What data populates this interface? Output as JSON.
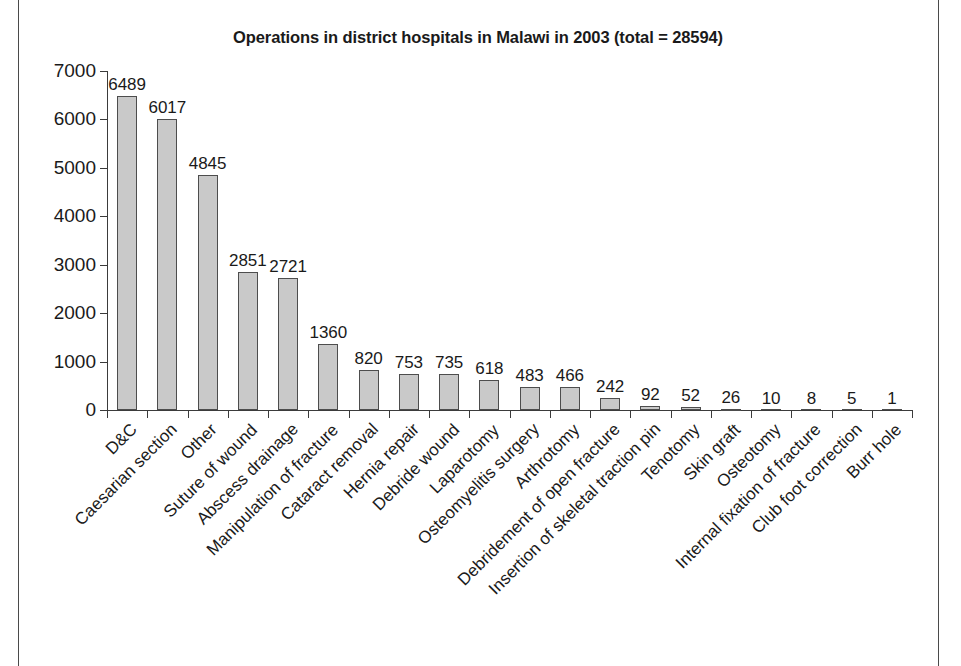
{
  "chart_data": {
    "type": "bar",
    "title": "Operations in district hospitals in Malawi in 2003 (total = 28594)",
    "xlabel": "",
    "ylabel": "",
    "ylim": [
      0,
      7000
    ],
    "yticks": [
      0,
      1000,
      2000,
      3000,
      4000,
      5000,
      6000,
      7000
    ],
    "ytick_labels": [
      "0",
      "1000",
      "2000",
      "3000",
      "4000",
      "5000",
      "6000",
      "7000"
    ],
    "grid": false,
    "legend": "none",
    "bar_color": "#c9c9c9",
    "bar_edge_color": "#4d4d4d",
    "data_labels_shown": true,
    "xtick_label_rotation": -45,
    "categories": [
      "D&C",
      "Caesarian section",
      "Other",
      "Suture of wound",
      "Abscess drainage",
      "Manipulation of fracture",
      "Cataract removal",
      "Hernia repair",
      "Debride wound",
      "Laparotomy",
      "Osteomyelitis surgery",
      "Arthrotomy",
      "Debridement of open fracture",
      "Insertion of skeletal traction pin",
      "Tenotomy",
      "Skin graft",
      "Osteotomy",
      "Internal fixation of fracture",
      "Club foot correction",
      "Burr hole"
    ],
    "values": [
      6489,
      6017,
      4845,
      2851,
      2721,
      1360,
      820,
      753,
      735,
      618,
      483,
      466,
      242,
      92,
      52,
      26,
      10,
      8,
      5,
      1
    ],
    "value_labels": [
      "6489",
      "6017",
      "4845",
      "2851",
      "2721",
      "1360",
      "820",
      "753",
      "735",
      "618",
      "483",
      "466",
      "242",
      "92",
      "52",
      "26",
      "10",
      "8",
      "5",
      "1"
    ],
    "total": 28594
  }
}
